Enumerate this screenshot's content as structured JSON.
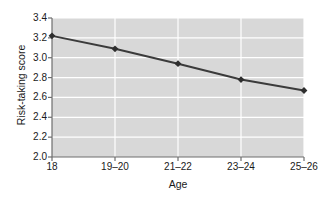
{
  "chart_data": {
    "type": "line",
    "title": "",
    "xlabel": "Age",
    "ylabel": "Risk-taking score",
    "categories": [
      "18",
      "19–20",
      "21–22",
      "23–24",
      "25–26"
    ],
    "values": [
      3.22,
      3.09,
      2.94,
      2.78,
      2.67
    ],
    "series": [
      {
        "name": "Risk-taking score",
        "values": [
          3.22,
          3.09,
          2.94,
          2.78,
          2.67
        ]
      }
    ],
    "ylim": [
      2.0,
      3.4
    ],
    "ytick_labels": [
      "3.4",
      "3.2",
      "3.0",
      "2.8",
      "2.6",
      "2.4",
      "2.2",
      "2.0"
    ],
    "ytick_values": [
      3.4,
      3.2,
      3.0,
      2.8,
      2.6,
      2.4,
      2.2,
      2.0
    ],
    "ystep": 0.2,
    "grid": "horizontal-and-vertical",
    "legend": "none",
    "marker": "diamond",
    "colors": {
      "plot_background": "#d8d8d8",
      "gridline": "#ffffff",
      "line": "#3b3b3b",
      "marker": "#2e2e2e",
      "axis": "#6e6e6e",
      "text": "#1a1a1a",
      "figure_background": "#ffffff"
    }
  }
}
